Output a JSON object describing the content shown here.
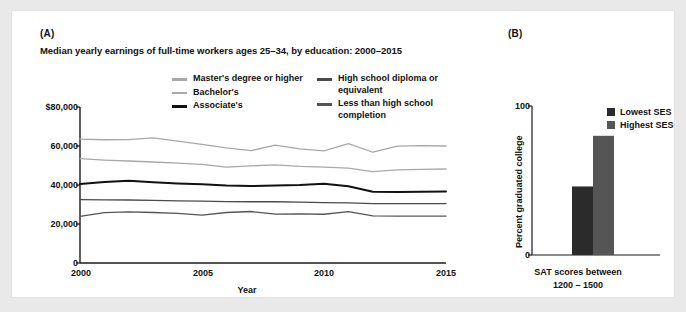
{
  "figure": {
    "background_color": "#e9e9ea",
    "card_color": "#ffffff"
  },
  "panel_a": {
    "letter": "(A)",
    "title": "Median yearly earnings of full-time workers ages 25–34, by education: 2000–2015",
    "legend": [
      {
        "label": "Master's degree or higher",
        "color": "#a8a8a8",
        "weight": "thin"
      },
      {
        "label": "Bachelor's",
        "color": "#a8a8a8",
        "weight": "thin"
      },
      {
        "label": "Associate's",
        "color": "#111111",
        "weight": "thick"
      },
      {
        "label": "High school diploma or equivalent",
        "color": "#4a4a4a",
        "weight": "thin"
      },
      {
        "label": "Less than high school completion",
        "color": "#555555",
        "weight": "thin"
      }
    ]
  },
  "panel_b": {
    "letter": "(B)",
    "legend": [
      {
        "label": "Lowest SES",
        "color": "#2b2b2b"
      },
      {
        "label": "Highest SES",
        "color": "#555555"
      }
    ]
  },
  "chart_data": [
    {
      "panel": "A",
      "type": "line",
      "title": "Median yearly earnings of full-time workers ages 25–34, by education: 2000–2015",
      "xlabel": "Year",
      "ylabel": "",
      "xlim": [
        2000,
        2015
      ],
      "ylim": [
        0,
        80000
      ],
      "xticks": [
        2000,
        2005,
        2010,
        2015
      ],
      "ytick_labels": [
        "$80,000",
        "60,000",
        "40,000",
        "20,000",
        "0"
      ],
      "yticks": [
        80000,
        60000,
        40000,
        20000,
        0
      ],
      "grid": false,
      "legend_position": "top-center",
      "x": [
        2000,
        2001,
        2002,
        2003,
        2004,
        2005,
        2006,
        2007,
        2008,
        2009,
        2010,
        2011,
        2012,
        2013,
        2014,
        2015
      ],
      "series": [
        {
          "name": "Master's degree or higher",
          "color": "#a8a8a8",
          "values": [
            63500,
            63200,
            63300,
            64200,
            62500,
            60800,
            59000,
            57600,
            60400,
            58500,
            57500,
            61200,
            56800,
            59900,
            60200,
            60000
          ]
        },
        {
          "name": "Bachelor's",
          "color": "#a8a8a8",
          "values": [
            53500,
            52800,
            52300,
            51800,
            51200,
            50600,
            49200,
            49800,
            50300,
            49600,
            49200,
            48700,
            46900,
            47800,
            48000,
            48200
          ]
        },
        {
          "name": "Associate's",
          "color": "#111111",
          "values": [
            40500,
            41500,
            42200,
            41400,
            40800,
            40400,
            39700,
            39500,
            39700,
            40000,
            40700,
            39400,
            36500,
            36400,
            36600,
            36700
          ]
        },
        {
          "name": "High school diploma or equivalent",
          "color": "#4a4a4a",
          "values": [
            32500,
            32400,
            32300,
            32100,
            31900,
            31700,
            31500,
            31400,
            31400,
            31200,
            31000,
            30800,
            30500,
            30400,
            30400,
            30500
          ]
        },
        {
          "name": "Less than high school completion",
          "color": "#555555",
          "values": [
            23900,
            25800,
            26200,
            25900,
            25500,
            24500,
            25900,
            26400,
            25100,
            25200,
            25000,
            26300,
            24200,
            24000,
            24000,
            24000
          ]
        }
      ]
    },
    {
      "panel": "B",
      "type": "bar",
      "title": "",
      "xlabel_line1": "SAT scores between",
      "xlabel_line2": "1200 – 1500",
      "ylabel": "Percent graduated college",
      "ylim": [
        0,
        100
      ],
      "yticks": [
        0,
        100
      ],
      "ytick_labels": [
        "0",
        "100"
      ],
      "grid": false,
      "legend_position": "top-right",
      "categories": [
        "Lowest SES",
        "Highest SES"
      ],
      "values": [
        46,
        80
      ],
      "colors": [
        "#2b2b2b",
        "#555555"
      ]
    }
  ]
}
